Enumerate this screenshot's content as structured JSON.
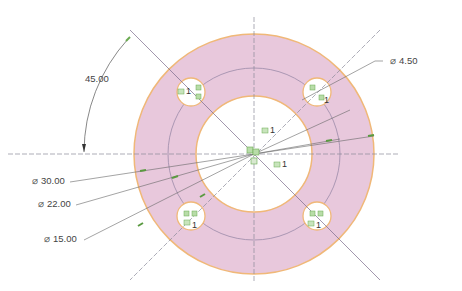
{
  "drawing": {
    "type": "flange plate with 4-hole bolt circle",
    "colors": {
      "part_fill": "#e8c8dc",
      "part_edge": "#f0b878",
      "centerline": "#8a8a9a",
      "dimension_line": "#666666",
      "construction_circle": "#9a8aa8",
      "constraint_badge": "#6aaa50",
      "background": "#ffffff"
    },
    "geometry": {
      "center": [
        254,
        154
      ],
      "outer_radius": 120,
      "pitch_radius": 86,
      "inner_radius": 58,
      "bolt_hole_radius": 14,
      "bolt_holes": [
        [
          191,
          92
        ],
        [
          317,
          92
        ],
        [
          191,
          216
        ],
        [
          317,
          216
        ]
      ]
    }
  },
  "dimensions": {
    "angle": {
      "value": "45.00"
    },
    "outer_diameter": {
      "symbol": "⌀",
      "value": "30.00"
    },
    "pitch_diameter": {
      "symbol": "⌀",
      "value": "22.00"
    },
    "inner_diameter": {
      "symbol": "⌀",
      "value": "15.00"
    },
    "hole_diameter": {
      "symbol": "⌀",
      "value": "4.50"
    }
  },
  "constraint_tags": {
    "count_label": "1"
  }
}
